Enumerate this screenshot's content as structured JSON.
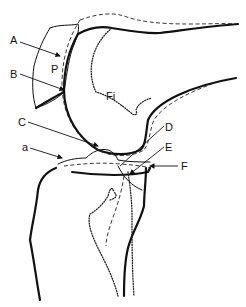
{
  "figure": {
    "labels": {
      "A": "A",
      "B": "B",
      "C": "C",
      "D": "D",
      "E": "E",
      "F": "F",
      "a": "a",
      "P": "P",
      "Fi": "Fi"
    }
  },
  "colors": {
    "line": "#111111",
    "background": "#ffffff"
  }
}
